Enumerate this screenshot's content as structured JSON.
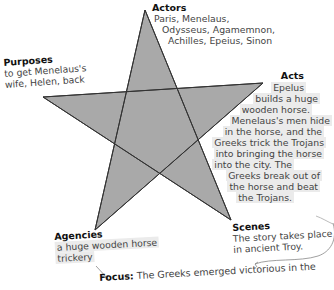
{
  "diagram": {
    "type": "pentad-star",
    "star": {
      "fill": "#a9a9a9",
      "stroke": "#333333",
      "vertices": {
        "top": [
          145,
          10
        ],
        "right": [
          263,
          83
        ],
        "bottom_right": [
          231,
          220
        ],
        "bottom_left": [
          95,
          230
        ],
        "left": [
          43,
          97
        ]
      }
    },
    "actors": {
      "heading": "Actors",
      "line1": "Paris, Menelaus,",
      "line2": "Odysseus, Agamemnon,",
      "line3": "Achilles, Epeius, Sinon"
    },
    "purposes": {
      "heading": "Purposes",
      "line1": "to get Menelaus's",
      "line2": "wife, Helen, back"
    },
    "acts": {
      "heading": "Acts",
      "lines": [
        "Epelus",
        "builds a huge",
        "wooden horse.",
        "Menelaus's men hide",
        "in the horse, and the",
        "Greeks trick the Trojans",
        "into bringing the horse",
        "into the city. The",
        "Greeks break out of",
        "the horse and beat",
        "the Trojans."
      ]
    },
    "scenes": {
      "heading": "Scenes",
      "line1": "The story takes place",
      "line2": "in ancient Troy."
    },
    "agencies": {
      "heading": "Agencies",
      "line1": "a huge wooden horse",
      "line2": "trickery"
    },
    "focus": {
      "heading": "Focus:",
      "text": "The Greeks emerged victorious in the",
      "text_cut": "...thanks to a giant wooden horse."
    },
    "highlight_color": "#ebebeb"
  }
}
